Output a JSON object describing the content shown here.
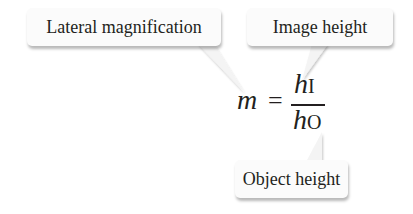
{
  "callouts": {
    "lateral_magnification": "Lateral magnification",
    "image_height": "Image height",
    "object_height": "Object height"
  },
  "formula": {
    "lhs": "m",
    "equals": "=",
    "numerator_var": "h",
    "numerator_sub": "I",
    "denominator_var": "h",
    "denominator_sub": "O"
  }
}
